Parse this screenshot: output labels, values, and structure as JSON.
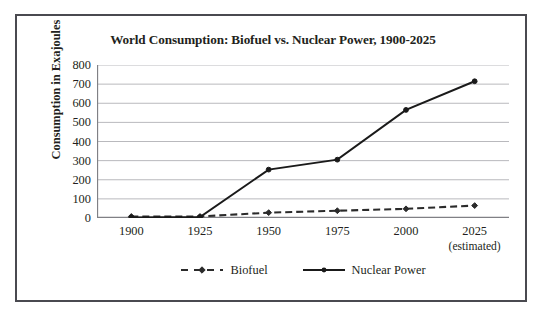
{
  "chart_data": {
    "type": "line",
    "title": "World Consumption: Biofuel vs. Nuclear Power, 1900-2025",
    "xlabel": "",
    "ylabel": "Consumption in Exajoules",
    "categories": [
      "1900",
      "1925",
      "1950",
      "1975",
      "2000",
      "2025"
    ],
    "x_tick_sublabels": [
      "",
      "",
      "",
      "",
      "",
      "(estimated)"
    ],
    "ylim": [
      0,
      800
    ],
    "y_ticks": [
      0,
      100,
      200,
      300,
      400,
      500,
      600,
      700,
      800
    ],
    "grid": true,
    "legend_position": "bottom",
    "series": [
      {
        "name": "Biofuel",
        "values": [
          8,
          8,
          28,
          38,
          48,
          65
        ],
        "line_style": "dashed",
        "marker": "diamond",
        "color": "#2b2b2b"
      },
      {
        "name": "Nuclear Power",
        "values": [
          3,
          5,
          253,
          305,
          565,
          715
        ],
        "line_style": "solid",
        "marker": "dot",
        "color": "#1a1a1a"
      }
    ]
  },
  "axes": {
    "y_tick_labels": [
      "800",
      "700",
      "600",
      "500",
      "400",
      "300",
      "200",
      "100",
      "0"
    ],
    "y_axis_title": "Consumption in Exajoules"
  },
  "legend": {
    "items": [
      {
        "label": "Biofuel"
      },
      {
        "label": "Nuclear Power"
      }
    ]
  },
  "colors": {
    "frame": "#4a4a50",
    "gridline": "#b9b9bd",
    "axis": "#808085",
    "biofuel": "#2b2b2b",
    "nuclear": "#1a1a1a",
    "text": "#231f20",
    "background": "#ffffff"
  }
}
